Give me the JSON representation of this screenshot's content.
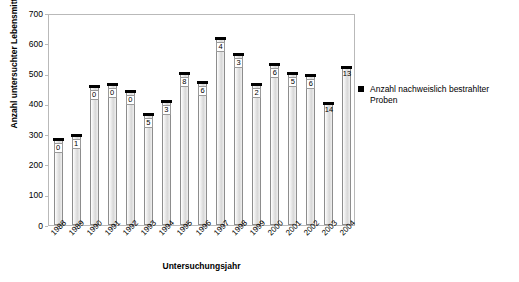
{
  "chart_data": {
    "type": "bar",
    "title": "",
    "xlabel": "Untersuchungsjahr",
    "ylabel": "Anzahl untersuchter Lebensmittel",
    "ylim": [
      0,
      700
    ],
    "yticks": [
      0,
      100,
      200,
      300,
      400,
      500,
      600,
      700
    ],
    "grid": false,
    "categories": [
      "1988",
      "1989",
      "1990",
      "1991",
      "1992",
      "1993",
      "1994",
      "1995",
      "1996",
      "1997",
      "1998",
      "1999",
      "2000",
      "2001",
      "2002",
      "2003",
      "2004"
    ],
    "series": [
      {
        "name": "Anzahl untersuchter Lebensmittel",
        "values": [
          282,
          295,
          455,
          462,
          440,
          362,
          405,
          500,
          470,
          615,
          562,
          462,
          528,
          497,
          492,
          398,
          520
        ]
      },
      {
        "name": "Anzahl nachweislich bestrahlter Proben",
        "values": [
          0,
          1,
          0,
          0,
          0,
          5,
          3,
          8,
          6,
          4,
          3,
          2,
          6,
          5,
          6,
          14,
          13
        ]
      }
    ],
    "legend": {
      "position": "right",
      "entries": [
        "Anzahl nachweislich bestrahlter Proben"
      ]
    },
    "point_labels": [
      "0",
      "1",
      "0",
      "0",
      "0",
      "5",
      "3",
      "8",
      "6",
      "4",
      "3",
      "2",
      "6",
      "5",
      "6",
      "14",
      "13"
    ]
  },
  "colors": {
    "bar_fill": "#d8d8d8",
    "bar_edge": "#8d8d8d",
    "marker": "#000000",
    "frame": "#b9b9b9",
    "background": "#ffffff"
  }
}
